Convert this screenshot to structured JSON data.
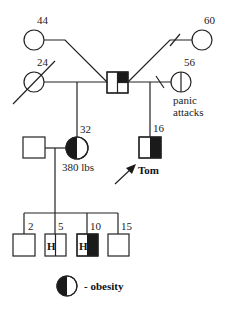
{
  "diagram": {
    "type": "pedigree",
    "colors": {
      "line": "#222222",
      "affected": "#1a1a1a",
      "unaffected": "#ffffff"
    },
    "individuals": {
      "grandmother_left_top": {
        "sex": "female",
        "age_label": "44"
      },
      "grandmother_left_bottom": {
        "sex": "female",
        "age_label": "24",
        "deceased": true
      },
      "central_male": {
        "sex": "male",
        "quartered": true,
        "filled_quadrant": "top-right"
      },
      "grandmother_right_top": {
        "sex": "female",
        "age_label": "60"
      },
      "grandmother_right_bottom": {
        "sex": "female",
        "age_label": "56",
        "note": "panic attacks",
        "vertical_line": true
      },
      "daughter": {
        "sex": "female",
        "age_label": "32",
        "note": "380 lbs",
        "affected": "left-half"
      },
      "daughter_spouse": {
        "sex": "male"
      },
      "proband": {
        "sex": "male",
        "age_label": "16",
        "name": "Tom",
        "affected": "right-half"
      },
      "child_1": {
        "sex": "male",
        "age_label": "2"
      },
      "child_2": {
        "sex": "male",
        "age_label": "5",
        "marker": "H"
      },
      "child_3": {
        "sex": "male",
        "age_label": "10",
        "marker": "H",
        "affected": "right-half"
      },
      "child_4": {
        "sex": "male",
        "age_label": "15"
      }
    },
    "labels": {
      "age_44": "44",
      "age_24": "24",
      "age_60": "60",
      "age_56": "56",
      "note_panic_1": "panic",
      "note_panic_2": "attacks",
      "age_32": "32",
      "note_weight": "380 lbs",
      "age_16": "16",
      "proband_name": "Tom",
      "age_2": "2",
      "age_5": "5",
      "age_10": "10",
      "age_15": "15",
      "marker_h_5": "H",
      "marker_h_10": "H"
    },
    "legend": {
      "symbol": "half-filled-circle",
      "text": "- obesity"
    }
  }
}
